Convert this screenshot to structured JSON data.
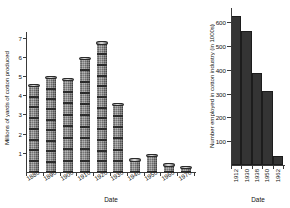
{
  "chart_data": [
    {
      "type": "bar",
      "id": "cotton-produced",
      "title": "",
      "xlabel": "Date",
      "ylabel": "Millions of yards of cotton produced",
      "categories": [
        "1880",
        "1890",
        "1900",
        "1910",
        "1920",
        "1930",
        "1940",
        "1950",
        "1960",
        "1970"
      ],
      "values": [
        4.5,
        4.9,
        4.8,
        5.9,
        6.7,
        3.5,
        0.6,
        0.85,
        0.35,
        0.2
      ],
      "ylim": [
        0,
        7.3
      ],
      "yticks": [
        1,
        2,
        3,
        4,
        5,
        6,
        7
      ],
      "ytick_labels": [
        "1",
        "2",
        "3",
        "4",
        "5",
        "6",
        "7"
      ],
      "grid": false,
      "legend": "none",
      "bar_style": "cotton-bobbin-stack",
      "bar_color": "#808080"
    },
    {
      "type": "bar",
      "id": "cotton-employment",
      "title": "",
      "xlabel": "Date",
      "ylabel": "Number employed in cotton industry (in 1000s)",
      "categories": [
        "1912",
        "1930",
        "1938",
        "1950",
        "1962"
      ],
      "values": [
        625,
        565,
        385,
        310,
        40
      ],
      "ylim": [
        0,
        660
      ],
      "yticks": [
        100,
        200,
        300,
        400,
        500,
        600
      ],
      "ytick_labels": [
        "100",
        "200",
        "300",
        "400",
        "500",
        "600"
      ],
      "grid": false,
      "legend": "none",
      "bar_color": "#343434"
    }
  ],
  "left_chart": {
    "ylabel": "Millions of yards of cotton produced",
    "xlabel": "Date",
    "ytick_labels": [
      "1",
      "2",
      "3",
      "4",
      "5",
      "6",
      "7"
    ],
    "xtick_labels": [
      "1880",
      "1890",
      "1900",
      "1910",
      "1920",
      "1930",
      "1940",
      "1950",
      "1960",
      "1970"
    ]
  },
  "right_chart": {
    "ylabel": "Number employed in cotton industry (in 1000s)",
    "xlabel": "Date",
    "ytick_labels": [
      "100",
      "200",
      "300",
      "400",
      "500",
      "600"
    ],
    "xtick_labels": [
      "1912",
      "1930",
      "1938",
      "1950",
      "1962"
    ]
  }
}
